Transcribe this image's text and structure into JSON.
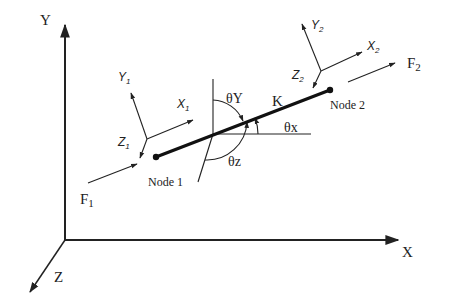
{
  "global_axes": {
    "origin": [
      65,
      240
    ],
    "x": {
      "label": "X",
      "tip": [
        398,
        240
      ],
      "label_pos": [
        402,
        257
      ]
    },
    "y": {
      "label": "Y",
      "tip": [
        65,
        25
      ],
      "label_pos": [
        40,
        25
      ]
    },
    "z": {
      "label": "Z",
      "tip": [
        30,
        292
      ],
      "label_pos": [
        54,
        282
      ]
    }
  },
  "element": {
    "stiffness_label": "K",
    "stiffness_label_pos": [
      272,
      106
    ],
    "node1": {
      "label": "Node 1",
      "pos": [
        156,
        157
      ],
      "label_pos": [
        148,
        186
      ]
    },
    "node2": {
      "label": "Node 2",
      "pos": [
        330,
        90
      ],
      "label_pos": [
        330,
        109
      ]
    },
    "reference_point": [
      213,
      134
    ]
  },
  "angles": {
    "theta_x": {
      "label": "θx",
      "label_pos": [
        284,
        132
      ]
    },
    "theta_y": {
      "label": "θY",
      "label_pos": [
        226,
        103
      ]
    },
    "theta_z": {
      "label": "θz",
      "label_pos": [
        228,
        166
      ]
    }
  },
  "local_frames": [
    {
      "name": "node1-frame",
      "origin": [
        147,
        139
      ],
      "x": {
        "label": "X",
        "sub": "1",
        "tip": [
          193,
          120
        ],
        "label_pos": [
          177,
          108
        ]
      },
      "y": {
        "label": "Y",
        "sub": "1",
        "tip": [
          131,
          93
        ],
        "label_pos": [
          118,
          81
        ]
      },
      "z": {
        "label": "Z",
        "sub": "1",
        "tip": [
          140,
          158
        ],
        "label_pos": [
          118,
          146
        ]
      }
    },
    {
      "name": "node2-frame",
      "origin": [
        321,
        71
      ],
      "x": {
        "label": "X",
        "sub": "2",
        "tip": [
          362,
          52
        ],
        "label_pos": [
          367,
          50
        ]
      },
      "y": {
        "label": "Y",
        "sub": "2",
        "tip": [
          302,
          24
        ],
        "label_pos": [
          311,
          29
        ]
      },
      "z": {
        "label": "Z",
        "sub": "2",
        "tip": [
          313,
          88
        ],
        "label_pos": [
          292,
          79
        ]
      }
    }
  ],
  "forces": [
    {
      "name": "F1",
      "label": "F",
      "sub": "1",
      "from": [
        88,
        183
      ],
      "to": [
        137,
        164
      ],
      "label_pos": [
        80,
        204
      ]
    },
    {
      "name": "F2",
      "label": "F",
      "sub": "2",
      "from": [
        348,
        82
      ],
      "to": [
        395,
        63
      ],
      "label_pos": [
        407,
        68
      ]
    }
  ]
}
